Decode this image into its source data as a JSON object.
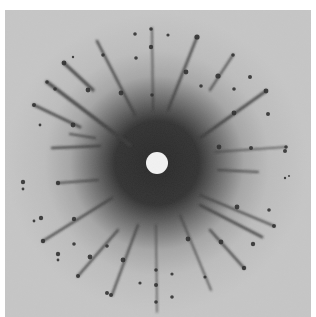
{
  "figure": {
    "colors": {
      "page_background": "#ffffff",
      "film_background": "#c4c4c4",
      "halo_dark": "#3a3a3a",
      "streak": "#3c3c3c",
      "spot": "#2e2e2e",
      "beam_stop": "#f2f2f2"
    },
    "center": [
      157,
      163
    ],
    "beam_stop_radius": 11,
    "streaks": [
      {
        "x1": 64,
        "y1": 63,
        "x2": 93,
        "y2": 90,
        "w": 3.2
      },
      {
        "x1": 47,
        "y1": 82,
        "x2": 130,
        "y2": 145,
        "w": 3.5
      },
      {
        "x1": 34,
        "y1": 105,
        "x2": 80,
        "y2": 127,
        "w": 3
      },
      {
        "x1": 97,
        "y1": 41,
        "x2": 135,
        "y2": 115,
        "w": 2.6
      },
      {
        "x1": 152,
        "y1": 28,
        "x2": 153,
        "y2": 110,
        "w": 1.6
      },
      {
        "x1": 197,
        "y1": 37,
        "x2": 168,
        "y2": 110,
        "w": 2.6
      },
      {
        "x1": 233,
        "y1": 55,
        "x2": 210,
        "y2": 90,
        "w": 2.2
      },
      {
        "x1": 266,
        "y1": 91,
        "x2": 200,
        "y2": 138,
        "w": 2.8
      },
      {
        "x1": 100,
        "y1": 146,
        "x2": 52,
        "y2": 148,
        "w": 2.4
      },
      {
        "x1": 95,
        "y1": 138,
        "x2": 70,
        "y2": 134,
        "w": 2.2
      },
      {
        "x1": 286,
        "y1": 147,
        "x2": 215,
        "y2": 152,
        "w": 1.6
      },
      {
        "x1": 258,
        "y1": 172,
        "x2": 218,
        "y2": 170,
        "w": 2
      },
      {
        "x1": 274,
        "y1": 226,
        "x2": 200,
        "y2": 195,
        "w": 2
      },
      {
        "x1": 262,
        "y1": 237,
        "x2": 200,
        "y2": 205,
        "w": 2.8
      },
      {
        "x1": 244,
        "y1": 268,
        "x2": 210,
        "y2": 230,
        "w": 2.6
      },
      {
        "x1": 211,
        "y1": 290,
        "x2": 180,
        "y2": 215,
        "w": 1.8
      },
      {
        "x1": 157,
        "y1": 312,
        "x2": 156,
        "y2": 225,
        "w": 1.4
      },
      {
        "x1": 112,
        "y1": 295,
        "x2": 138,
        "y2": 225,
        "w": 2.2
      },
      {
        "x1": 78,
        "y1": 276,
        "x2": 118,
        "y2": 230,
        "w": 2.4
      },
      {
        "x1": 43,
        "y1": 241,
        "x2": 112,
        "y2": 198,
        "w": 2.6
      },
      {
        "x1": 58,
        "y1": 183,
        "x2": 98,
        "y2": 180,
        "w": 2
      }
    ],
    "spots": [
      {
        "x": 64,
        "y": 63,
        "r": 2.4
      },
      {
        "x": 88,
        "y": 90,
        "r": 2.4
      },
      {
        "x": 47,
        "y": 82,
        "r": 1.8
      },
      {
        "x": 55,
        "y": 89,
        "r": 1.8
      },
      {
        "x": 34,
        "y": 105,
        "r": 2
      },
      {
        "x": 73,
        "y": 125,
        "r": 2.4
      },
      {
        "x": 103,
        "y": 55,
        "r": 1.8
      },
      {
        "x": 121,
        "y": 93,
        "r": 2.4
      },
      {
        "x": 135,
        "y": 34,
        "r": 1.8
      },
      {
        "x": 151,
        "y": 29,
        "r": 1.8
      },
      {
        "x": 151,
        "y": 47,
        "r": 2.2
      },
      {
        "x": 136,
        "y": 58,
        "r": 1.8
      },
      {
        "x": 152,
        "y": 95,
        "r": 1.8
      },
      {
        "x": 40,
        "y": 125,
        "r": 1.4
      },
      {
        "x": 73,
        "y": 57,
        "r": 1.2
      },
      {
        "x": 197,
        "y": 37,
        "r": 2.6
      },
      {
        "x": 186,
        "y": 72,
        "r": 2.4
      },
      {
        "x": 168,
        "y": 35,
        "r": 1.6
      },
      {
        "x": 233,
        "y": 55,
        "r": 1.8
      },
      {
        "x": 218,
        "y": 76,
        "r": 2.6
      },
      {
        "x": 250,
        "y": 77,
        "r": 2
      },
      {
        "x": 234,
        "y": 89,
        "r": 1.8
      },
      {
        "x": 201,
        "y": 86,
        "r": 1.8
      },
      {
        "x": 266,
        "y": 91,
        "r": 2.4
      },
      {
        "x": 234,
        "y": 113,
        "r": 2.4
      },
      {
        "x": 268,
        "y": 114,
        "r": 2
      },
      {
        "x": 286,
        "y": 147,
        "r": 1.8
      },
      {
        "x": 285,
        "y": 151,
        "r": 2
      },
      {
        "x": 251,
        "y": 148,
        "r": 2
      },
      {
        "x": 219,
        "y": 147,
        "r": 2.4
      },
      {
        "x": 23,
        "y": 182,
        "r": 2.2
      },
      {
        "x": 23,
        "y": 189,
        "r": 1.4
      },
      {
        "x": 58,
        "y": 183,
        "r": 2.2
      },
      {
        "x": 41,
        "y": 218,
        "r": 2.2
      },
      {
        "x": 34,
        "y": 221,
        "r": 1.4
      },
      {
        "x": 43,
        "y": 241,
        "r": 2.2
      },
      {
        "x": 74,
        "y": 219,
        "r": 2.2
      },
      {
        "x": 74,
        "y": 244,
        "r": 1.8
      },
      {
        "x": 58,
        "y": 254,
        "r": 2.2
      },
      {
        "x": 58,
        "y": 260,
        "r": 1.4
      },
      {
        "x": 90,
        "y": 257,
        "r": 2.4
      },
      {
        "x": 107,
        "y": 246,
        "r": 1.8
      },
      {
        "x": 78,
        "y": 276,
        "r": 2
      },
      {
        "x": 123,
        "y": 260,
        "r": 2.4
      },
      {
        "x": 107,
        "y": 293,
        "r": 2
      },
      {
        "x": 111,
        "y": 295,
        "r": 2
      },
      {
        "x": 140,
        "y": 283,
        "r": 1.6
      },
      {
        "x": 156,
        "y": 285,
        "r": 2
      },
      {
        "x": 156,
        "y": 302,
        "r": 1.8
      },
      {
        "x": 172,
        "y": 297,
        "r": 1.8
      },
      {
        "x": 237,
        "y": 207,
        "r": 2.4
      },
      {
        "x": 269,
        "y": 210,
        "r": 1.8
      },
      {
        "x": 274,
        "y": 226,
        "r": 2
      },
      {
        "x": 253,
        "y": 244,
        "r": 2.2
      },
      {
        "x": 244,
        "y": 268,
        "r": 2.2
      },
      {
        "x": 221,
        "y": 242,
        "r": 2.4
      },
      {
        "x": 188,
        "y": 239,
        "r": 2.4
      },
      {
        "x": 205,
        "y": 277,
        "r": 1.6
      },
      {
        "x": 172,
        "y": 274,
        "r": 1.6
      },
      {
        "x": 156,
        "y": 270,
        "r": 1.8
      },
      {
        "x": 285,
        "y": 178,
        "r": 1.2
      },
      {
        "x": 289,
        "y": 176,
        "r": 1
      }
    ]
  }
}
